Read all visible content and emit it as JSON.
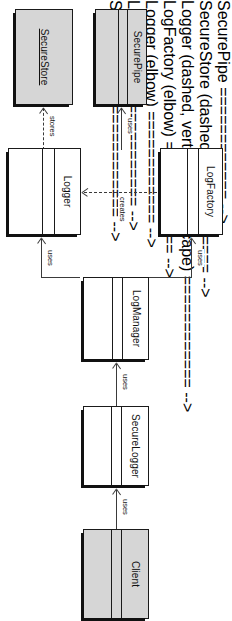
{
  "diagram": {
    "type": "uml-class-diagram",
    "orientation": "rotated-90-clockwise",
    "colors": {
      "fill_gray": "#d6d6d6",
      "fill_white": "#ffffff",
      "stroke": "#1a1a1a",
      "connector": "#3a3a3a",
      "shadow": "#111111"
    },
    "classes": [
      {
        "id": "securepipe",
        "name": "SecurePipe",
        "fill": "gray",
        "compartments": 3,
        "name_underlined": false
      },
      {
        "id": "securestore",
        "name": "SecureStore",
        "fill": "gray",
        "compartments": 1,
        "name_underlined": true
      },
      {
        "id": "logfactory",
        "name": "LogFactory",
        "fill": "white",
        "compartments": 3,
        "name_underlined": false
      },
      {
        "id": "logger",
        "name": "Logger",
        "fill": "white",
        "compartments": 3,
        "name_underlined": false
      },
      {
        "id": "logmanager",
        "name": "LogManager",
        "fill": "white",
        "compartments": 3,
        "name_underlined": false
      },
      {
        "id": "securelogger",
        "name": "SecureLogger",
        "fill": "white",
        "compartments": 3,
        "name_underlined": false
      },
      {
        "id": "client",
        "name": "Client",
        "fill": "gray",
        "compartments": 3,
        "name_underlined": false
      }
    ],
    "connectors": [
      {
        "id": "logger-uses-securepipe",
        "label": "uses",
        "from": "Logger",
        "to": "SecurePipe",
        "style": "solid",
        "arrow": "open"
      },
      {
        "id": "logger-stores-securestore",
        "label": "stores",
        "from": "Logger",
        "to": "SecureStore",
        "style": "dashed",
        "arrow": "open"
      },
      {
        "id": "logfactory-creates-logger",
        "label": "creates",
        "from": "LogFactory",
        "to": "Logger",
        "style": "dashed",
        "arrow": "open"
      },
      {
        "id": "logmanager-uses-logfactory",
        "label": "uses",
        "from": "LogManager",
        "to": "LogFactory",
        "style": "solid",
        "arrow": "open"
      },
      {
        "id": "logmanager-uses-logger",
        "label": "uses",
        "from": "LogManager",
        "to": "Logger",
        "style": "solid",
        "arrow": "open"
      },
      {
        "id": "securelogger-uses-logmanager",
        "label": "uses",
        "from": "SecureLogger",
        "to": "LogManager",
        "style": "solid",
        "arrow": "open"
      },
      {
        "id": "client-uses-securelogger",
        "label": "uses",
        "from": "Client",
        "to": "SecureLogger",
        "style": "solid",
        "arrow": "open"
      }
    ]
  }
}
